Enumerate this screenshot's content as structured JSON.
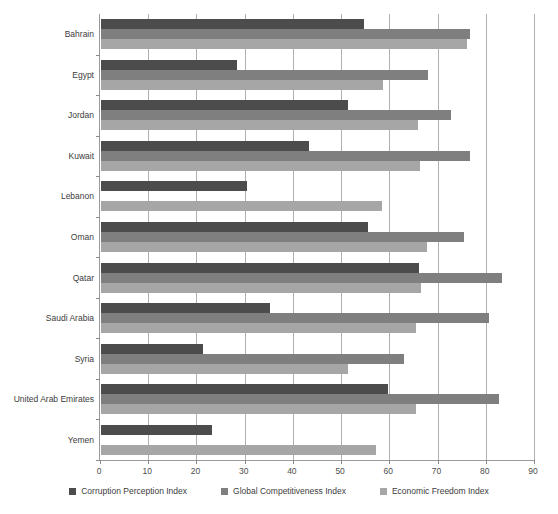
{
  "chart_data": {
    "type": "bar",
    "orientation": "horizontal",
    "title": "",
    "xlabel": "",
    "ylabel": "",
    "xlim": [
      0,
      90
    ],
    "xticks": [
      0,
      10,
      20,
      30,
      40,
      50,
      60,
      70,
      80,
      90
    ],
    "grid": "vertical",
    "legend_position": "bottom",
    "categories": [
      "Bahrain",
      "Egypt",
      "Jordan",
      "Kuwait",
      "Lebanon",
      "Oman",
      "Qatar",
      "Saudi Arabia",
      "Syria",
      "United Arab Emirates",
      "Yemen"
    ],
    "series": [
      {
        "name": "Corruption Perception Index",
        "color": "#4c4c4c",
        "values": [
          54.5,
          28.1,
          51.3,
          43.2,
          30.2,
          55.3,
          66.0,
          35.0,
          21.2,
          59.6,
          23.1
        ]
      },
      {
        "name": "Global Competitiveness Index",
        "color": "#7f7f7f",
        "values": [
          76.5,
          67.9,
          72.5,
          76.5,
          0,
          75.2,
          83.1,
          80.4,
          62.8,
          82.5,
          0
        ]
      },
      {
        "name": "Economic Freedom Index",
        "color": "#a6a6a6",
        "values": [
          75.8,
          58.5,
          65.8,
          66.2,
          58.3,
          67.5,
          66.4,
          65.3,
          51.3,
          65.3,
          57.1
        ]
      }
    ]
  }
}
